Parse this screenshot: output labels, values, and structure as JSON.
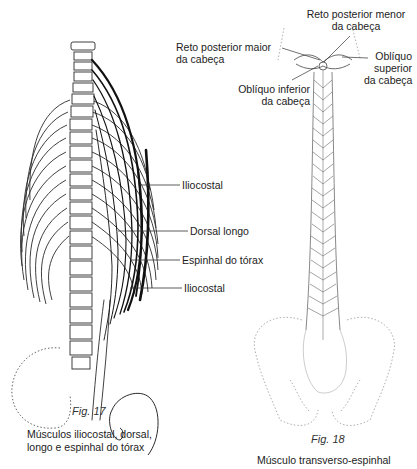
{
  "figures": [
    {
      "id": "fig17",
      "number": "Fig. 17",
      "caption_line1": "Músculos iliocostal, dorsal,",
      "caption_line2": "longo e espinhal do tórax",
      "labels": [
        {
          "text": "Iliocostal"
        },
        {
          "text": "Dorsal longo"
        },
        {
          "text": "Espinhal do tórax"
        },
        {
          "text": "Iliocostal"
        }
      ]
    },
    {
      "id": "fig18",
      "number": "Fig. 18",
      "caption_line1": "Músculo transverso-espinhal",
      "labels": [
        {
          "line1": "Reto posterior menor",
          "line2": "da cabeça"
        },
        {
          "line1": "Reto posterior maior",
          "line2": "da cabeça"
        },
        {
          "line1": "Oblíquo",
          "line2": "superior",
          "line3": "da cabeça"
        },
        {
          "line1": "Oblíquo inferior",
          "line2": "da cabeça"
        }
      ]
    }
  ]
}
